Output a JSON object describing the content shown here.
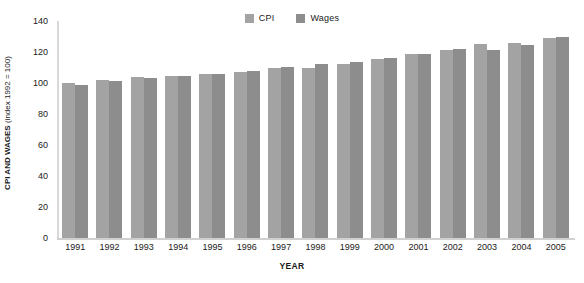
{
  "chart_data": {
    "type": "bar",
    "title": "",
    "xlabel": "YEAR",
    "ylabel": "CPI AND WAGES (index 1992 = 100)",
    "ylabel_bold_part": "CPI AND WAGES",
    "ylabel_regular_part": " (index 1992 = 100)",
    "categories": [
      "1991",
      "1992",
      "1993",
      "1994",
      "1995",
      "1996",
      "1997",
      "1998",
      "1999",
      "2000",
      "2001",
      "2002",
      "2003",
      "2004",
      "2005"
    ],
    "series": [
      {
        "name": "CPI",
        "color": "#a3a3a3",
        "values": [
          100,
          102,
          104,
          104.5,
          105.5,
          107,
          109.5,
          110,
          112,
          115.5,
          118.5,
          121,
          125,
          126,
          129
        ]
      },
      {
        "name": "Wages",
        "color": "#8d8d8d",
        "values": [
          99,
          101.5,
          103.5,
          104.5,
          106,
          108,
          110.5,
          112,
          113.5,
          116,
          119,
          122,
          121.5,
          124.5,
          129.5
        ]
      }
    ],
    "ylim": [
      0,
      140
    ],
    "yticks": [
      0,
      20,
      40,
      60,
      80,
      100,
      120,
      140
    ],
    "grid": false,
    "legend_position": "top-center"
  },
  "legend": {
    "items": [
      {
        "label": "CPI",
        "color": "#a3a3a3"
      },
      {
        "label": "Wages",
        "color": "#8d8d8d"
      }
    ]
  },
  "icons": {
    "legend_swatch": "square-swatch-icon"
  }
}
